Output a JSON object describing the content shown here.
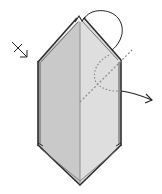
{
  "diagram": {
    "type": "origami-step",
    "colors": {
      "paper_left": "#c8c8c8",
      "paper_right": "#dadada",
      "edge": "#2a2a2a",
      "edge_shadow": "#777777",
      "crease": "#888888",
      "dotted": "#8a8a8a",
      "arrow": "#222222",
      "background": "#ffffff"
    },
    "symbols": [
      {
        "name": "turn-over-arrow",
        "position": "upper-left"
      },
      {
        "name": "fold-arc-arrow",
        "position": "top-right"
      },
      {
        "name": "valley-fold-line",
        "position": "right"
      },
      {
        "name": "pull-out-arrow",
        "position": "right"
      }
    ]
  }
}
